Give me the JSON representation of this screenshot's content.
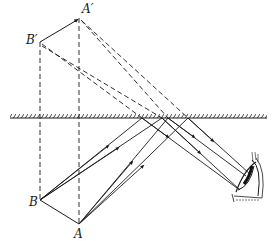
{
  "diagram": {
    "type": "plane-mirror-image-formation",
    "labels": {
      "A_prime": "A′",
      "B_prime": "B′",
      "A": "A",
      "B": "B"
    },
    "points": {
      "A_prime": [
        79,
        18
      ],
      "B_prime": [
        40,
        42
      ],
      "A": [
        79,
        224
      ],
      "B": [
        40,
        200
      ]
    },
    "mirror": {
      "y": 118,
      "x_start": 10,
      "x_end": 267
    },
    "eye": {
      "position": [
        240,
        178
      ]
    },
    "colors": {
      "ink": "#1a1a1a",
      "background": "#ffffff"
    }
  }
}
